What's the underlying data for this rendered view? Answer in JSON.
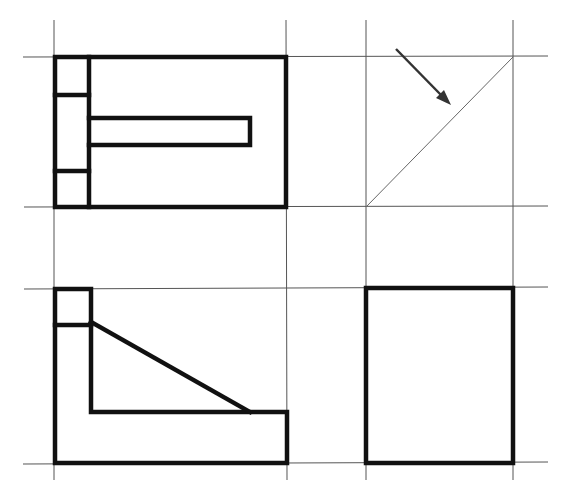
{
  "drawing": {
    "type": "orthographic-projection",
    "colors": {
      "background": "#ffffff",
      "visible_line": "#111111",
      "construction_line": "#555555",
      "miter_line": "#666666",
      "arrow": "#333333"
    },
    "construction_lines": {
      "vertical_x": [
        54,
        286,
        366,
        513
      ],
      "vertical_y_range": [
        20,
        480
      ],
      "horizontal_y": [
        57,
        207,
        288,
        463
      ],
      "horizontal_x_range": [
        23,
        548
      ]
    },
    "views": {
      "top_view": {
        "outer": [
          55,
          57,
          286,
          207
        ],
        "inner_vertical_x": 89,
        "horizontal_dividers_y": [
          95,
          171
        ],
        "slot": [
          89,
          118,
          250,
          145
        ]
      },
      "miter_square": {
        "diagonal": [
          366,
          207,
          513,
          57
        ],
        "arrow": {
          "from": [
            396,
            49
          ],
          "to": [
            450,
            104
          ]
        }
      },
      "front_view": {
        "outer_points": [
          [
            55,
            289
          ],
          [
            91,
            289
          ],
          [
            91,
            412
          ],
          [
            287,
            412
          ],
          [
            287,
            463
          ],
          [
            55,
            463
          ]
        ],
        "small_box_bottom_y": 325,
        "rib_diagonal": [
          91,
          322,
          250,
          412
        ]
      },
      "side_view": {
        "outer": [
          366,
          288,
          513,
          463
        ]
      }
    }
  }
}
